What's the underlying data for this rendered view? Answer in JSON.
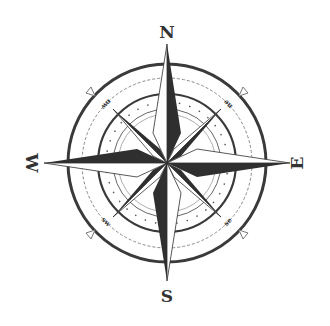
{
  "figure": {
    "type": "compass-rose",
    "center": [
      167,
      163
    ],
    "colors": {
      "ink": "#333333",
      "light_ink": "#8a8a8a",
      "background": "#ffffff"
    },
    "labels": {
      "north": "N",
      "south": "S",
      "east": "E",
      "west": "W",
      "northwest": "nw",
      "northeast": "ne",
      "southwest": "sw",
      "southeast": "se"
    }
  }
}
